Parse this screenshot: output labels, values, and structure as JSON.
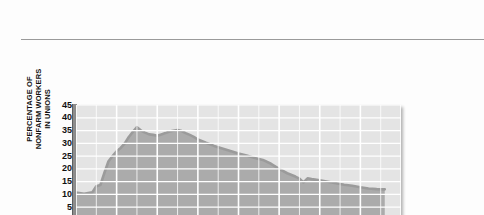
{
  "figure": {
    "y_axis_title_lines": [
      "PERCENTAGE OF",
      "NONFARM WORKERS",
      "IN UNIONS"
    ],
    "x_axis_title": "YEAR"
  },
  "chart_data": {
    "type": "area",
    "title": "",
    "subtitle": "",
    "xlabel": "YEAR",
    "ylabel": "PERCENTAGE OF NONFARM WORKERS IN UNIONS",
    "xlim": [
      1930,
      2010
    ],
    "ylim": [
      0,
      45
    ],
    "xticks": [
      1930,
      1940,
      1950,
      1960,
      1970,
      1980,
      1990,
      2000,
      2010
    ],
    "yticks": [
      0,
      5,
      10,
      15,
      20,
      25,
      30,
      35,
      40,
      45
    ],
    "grid": true,
    "legend": "none",
    "line_color": "#9b9b9b",
    "fill_color": "#ababab",
    "plot_background": "#e4e4e4",
    "gridline_color": "#ffffff",
    "series": [
      {
        "name": "Percentage of nonfarm workers in unions",
        "x": [
          1930,
          1932,
          1934,
          1935,
          1936,
          1937,
          1938,
          1939,
          1940,
          1941,
          1942,
          1943,
          1944,
          1945,
          1946,
          1947,
          1948,
          1949,
          1950,
          1951,
          1952,
          1953,
          1954,
          1955,
          1956,
          1957,
          1958,
          1959,
          1960,
          1962,
          1964,
          1966,
          1968,
          1970,
          1972,
          1974,
          1976,
          1978,
          1980,
          1982,
          1984,
          1985,
          1986,
          1987,
          1988,
          1990,
          1992,
          1994,
          1996,
          1998,
          2000,
          2002,
          2004,
          2006
        ],
        "y": [
          10.7,
          10.3,
          10.8,
          13.2,
          13.7,
          18.5,
          23.0,
          25.0,
          26.9,
          28.2,
          30.0,
          32.5,
          34.5,
          36.3,
          35.0,
          34.2,
          33.5,
          33.3,
          33.0,
          33.5,
          34.0,
          34.6,
          34.9,
          35.2,
          34.8,
          34.0,
          33.3,
          32.5,
          31.5,
          30.2,
          29.0,
          28.0,
          27.0,
          26.0,
          25.2,
          24.3,
          23.5,
          22.0,
          20.0,
          18.3,
          17.0,
          16.2,
          14.7,
          16.3,
          16.0,
          15.5,
          15.0,
          14.4,
          13.8,
          13.4,
          12.8,
          12.3,
          12.1,
          12.0
        ]
      }
    ]
  }
}
